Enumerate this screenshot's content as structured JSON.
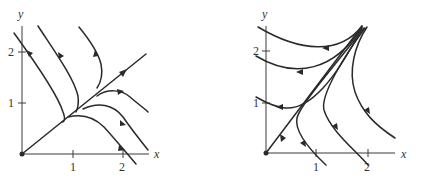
{
  "figure": {
    "left_panel": {
      "axis_labels": {
        "x": "x",
        "y": "y"
      },
      "x_ticks": [
        "1",
        "2"
      ],
      "y_ticks": [
        "1",
        "2"
      ],
      "description": "Phase portrait: unstable node-like flow; trajectories approach the line y = x/... and flow outward along it, curves from upper left descend then turn along diagonal"
    },
    "right_panel": {
      "axis_labels": {
        "x": "x",
        "y": "y"
      },
      "x_ticks": [
        "1",
        "2"
      ],
      "y_ticks": [
        "1",
        "2"
      ],
      "description": "Phase portrait: trajectories emanate from a point near upper right and flow outward; diagonal separatrix toward origin"
    }
  }
}
